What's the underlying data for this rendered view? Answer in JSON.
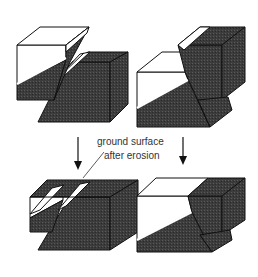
{
  "figure": {
    "annotation": {
      "line1": "ground surface",
      "line2": "after erosion"
    },
    "panels": [
      {
        "id": "top-left",
        "label": "normal fault before erosion"
      },
      {
        "id": "top-right",
        "label": "reverse fault before erosion"
      },
      {
        "id": "bottom-left",
        "label": "normal fault after erosion"
      },
      {
        "id": "bottom-right",
        "label": "reverse fault after erosion"
      }
    ],
    "colors": {
      "rock_dark": "#3c3c3c",
      "rock_light": "#ffffff",
      "outline": "#111111",
      "annotation": "#333333"
    }
  }
}
